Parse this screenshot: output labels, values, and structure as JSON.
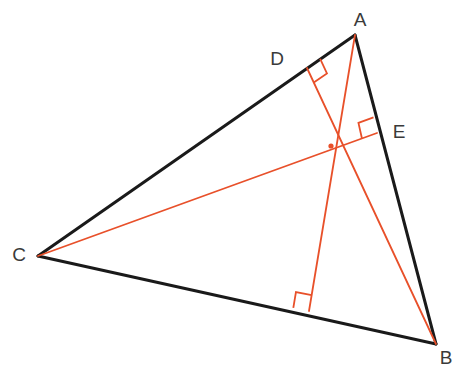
{
  "figure": {
    "background_color": "#ffffff",
    "side_color": "#1a1a1a",
    "altitude_color": "#e8502a",
    "label_color": "#3a3a3a",
    "side_stroke_width": 3,
    "altitude_stroke_width": 1.8,
    "right_angle_stroke_width": 1.8,
    "right_angle_size": 16
  },
  "points": {
    "A": {
      "name": "A",
      "x": 355,
      "y": 35,
      "label": "A",
      "label_x": 360,
      "label_y": 21
    },
    "B": {
      "name": "B",
      "x": 436,
      "y": 344,
      "label": "B",
      "label_x": 446,
      "label_y": 359
    },
    "C": {
      "name": "C",
      "x": 38,
      "y": 256,
      "label": "C",
      "label_x": 19,
      "label_y": 256
    },
    "D": {
      "name": "D",
      "x": 307,
      "y": 68,
      "label": "D",
      "label_x": 277,
      "label_y": 60
    },
    "E": {
      "name": "E",
      "x": 377,
      "y": 133,
      "label": "E",
      "label_x": 399,
      "label_y": 133
    },
    "F": {
      "name": "F",
      "x": 309,
      "y": 311,
      "label": "",
      "label_x": 309,
      "label_y": 311
    },
    "H": {
      "name": "H",
      "x": 331,
      "y": 146,
      "label": "",
      "label_x": 331,
      "label_y": 146
    }
  },
  "sides": [
    {
      "name": "side-AC",
      "from": "A",
      "to": "C",
      "label": "AC"
    },
    {
      "name": "side-AB",
      "from": "A",
      "to": "B",
      "label": "AB"
    },
    {
      "name": "side-CB",
      "from": "C",
      "to": "B",
      "label": "CB"
    }
  ],
  "altitudes": [
    {
      "name": "altitude-A-to-F",
      "from": "A",
      "to": "F",
      "label": "altitude from A to BC"
    },
    {
      "name": "altitude-B-to-D",
      "from": "B",
      "to": "D",
      "label": "altitude from B to AC"
    },
    {
      "name": "altitude-C-to-E",
      "from": "C",
      "to": "E",
      "label": "altitude from C to AB"
    }
  ],
  "right_angles": [
    {
      "name": "right-angle-at-D",
      "at": "D",
      "toward_vertex": "A",
      "toward_foot_source": "B"
    },
    {
      "name": "right-angle-at-E",
      "at": "E",
      "toward_vertex": "A",
      "toward_foot_source": "C"
    },
    {
      "name": "right-angle-at-F",
      "at": "F",
      "toward_vertex": "C",
      "toward_foot_source": "A"
    }
  ],
  "orthocenter": {
    "name": "orthocenter-dot",
    "x": 331,
    "y": 146,
    "radius": 2.6,
    "label": ""
  }
}
